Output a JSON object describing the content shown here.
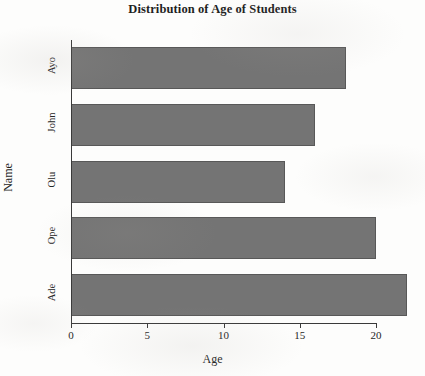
{
  "chart_data": {
    "type": "bar",
    "orientation": "horizontal",
    "title": "Distribution of Age of Students",
    "xlabel": "Age",
    "ylabel": "Name",
    "categories": [
      "Ade",
      "Ope",
      "Olu",
      "John",
      "Ayo"
    ],
    "values": [
      22,
      20,
      14,
      16,
      18
    ],
    "xlim": [
      0,
      22.6
    ],
    "xticks": [
      0,
      5,
      10,
      15,
      20
    ],
    "xtick_labels": [
      "0",
      "5",
      "10",
      "15",
      "20"
    ],
    "grid": false,
    "legend": false,
    "bar_color": "#747474",
    "bar_edge_color": "#585858",
    "background_color": "#fdfdfc",
    "axis_color": "#3a3a3a"
  },
  "axis": {
    "x_title": "Age",
    "y_title": "Name"
  }
}
